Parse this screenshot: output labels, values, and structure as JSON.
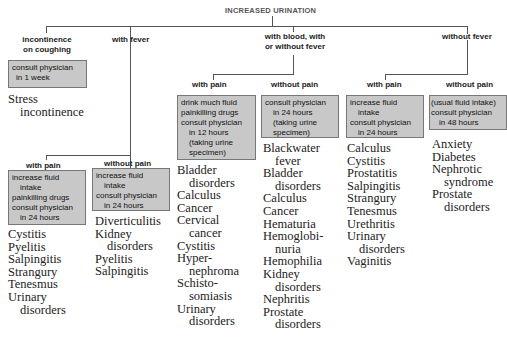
{
  "title": "INCREASED URINATION",
  "branches": {
    "incontinence": {
      "label": [
        "incontinence",
        "on coughing"
      ],
      "advice": [
        {
          "t": "consult physician",
          "i": false
        },
        {
          "t": "in 1 week",
          "i": true
        }
      ],
      "conditions": [
        {
          "t": "Stress",
          "i": false
        },
        {
          "t": "incontinence",
          "i": true
        }
      ]
    },
    "fever": {
      "label": "with fever",
      "with_pain": {
        "label": "with pain",
        "advice": [
          {
            "t": "increase fluid",
            "i": false
          },
          {
            "t": "intake",
            "i": true
          },
          {
            "t": "painkilling drugs",
            "i": false
          },
          {
            "t": "consult physician",
            "i": false
          },
          {
            "t": "in 24 hours",
            "i": true
          }
        ],
        "conditions": [
          {
            "t": "Cystitis",
            "i": false
          },
          {
            "t": "Pyelitis",
            "i": false
          },
          {
            "t": "Salpingitis",
            "i": false
          },
          {
            "t": "Strangury",
            "i": false
          },
          {
            "t": "Tenesmus",
            "i": false
          },
          {
            "t": "Urinary",
            "i": false
          },
          {
            "t": "disorders",
            "i": true
          }
        ]
      },
      "without_pain": {
        "label": "without pain",
        "advice": [
          {
            "t": "increase fluid",
            "i": false
          },
          {
            "t": "intake",
            "i": true
          },
          {
            "t": "consult physician",
            "i": false
          },
          {
            "t": "in 24 hours",
            "i": true
          }
        ],
        "conditions": [
          {
            "t": "Diverticulitis",
            "i": false
          },
          {
            "t": "Kidney",
            "i": false
          },
          {
            "t": "disorders",
            "i": true
          },
          {
            "t": "Pyelitis",
            "i": false
          },
          {
            "t": "Salpingitis",
            "i": false
          }
        ]
      }
    },
    "blood": {
      "label": [
        "with blood, with",
        "or without fever"
      ],
      "with_pain": {
        "label": "with pain",
        "advice": [
          {
            "t": "drink much fluid",
            "i": false
          },
          {
            "t": "painkilling drugs",
            "i": false
          },
          {
            "t": "consult physician",
            "i": false
          },
          {
            "t": "in 12 hours",
            "i": true
          },
          {
            "t": "(taking urine",
            "i": true
          },
          {
            "t": "specimen)",
            "i": true
          }
        ],
        "conditions": [
          {
            "t": "Bladder",
            "i": false
          },
          {
            "t": "disorders",
            "i": true
          },
          {
            "t": "Calculus",
            "i": false
          },
          {
            "t": "Cancer",
            "i": false
          },
          {
            "t": "Cervical",
            "i": false
          },
          {
            "t": "cancer",
            "i": true
          },
          {
            "t": "Cystitis",
            "i": false
          },
          {
            "t": "Hyper-",
            "i": false
          },
          {
            "t": "nephroma",
            "i": true
          },
          {
            "t": "Schisto-",
            "i": false
          },
          {
            "t": "somiasis",
            "i": true
          },
          {
            "t": "Urinary",
            "i": false
          },
          {
            "t": "disorders",
            "i": true
          }
        ]
      },
      "without_pain": {
        "label": "without pain",
        "advice": [
          {
            "t": "consult physician",
            "i": false
          },
          {
            "t": "in 24 hours",
            "i": true
          },
          {
            "t": "(taking urine",
            "i": true
          },
          {
            "t": "specimen)",
            "i": true
          }
        ],
        "conditions": [
          {
            "t": "Blackwater",
            "i": false
          },
          {
            "t": "fever",
            "i": true
          },
          {
            "t": "Bladder",
            "i": false
          },
          {
            "t": "disorders",
            "i": true
          },
          {
            "t": "Calculus",
            "i": false
          },
          {
            "t": "Cancer",
            "i": false
          },
          {
            "t": "Hematuria",
            "i": false
          },
          {
            "t": "Hemoglobi-",
            "i": false
          },
          {
            "t": "nuria",
            "i": true
          },
          {
            "t": "Hemophilia",
            "i": false
          },
          {
            "t": "Kidney",
            "i": false
          },
          {
            "t": "disorders",
            "i": true
          },
          {
            "t": "Nephritis",
            "i": false
          },
          {
            "t": "Prostate",
            "i": false
          },
          {
            "t": "disorders",
            "i": true
          }
        ]
      }
    },
    "no_fever": {
      "label": "without fever",
      "with_pain": {
        "label": "with pain",
        "advice": [
          {
            "t": "increase fluid",
            "i": false
          },
          {
            "t": "intake",
            "i": true
          },
          {
            "t": "consult physician",
            "i": false
          },
          {
            "t": "in 24 hours",
            "i": true
          }
        ],
        "conditions": [
          {
            "t": "Calculus",
            "i": false
          },
          {
            "t": "Cystitis",
            "i": false
          },
          {
            "t": "Prostatitis",
            "i": false
          },
          {
            "t": "Salpingitis",
            "i": false
          },
          {
            "t": "Strangury",
            "i": false
          },
          {
            "t": "Tenesmus",
            "i": false
          },
          {
            "t": "Urethritis",
            "i": false
          },
          {
            "t": "Urinary",
            "i": false
          },
          {
            "t": "disorders",
            "i": true
          },
          {
            "t": "Vaginitis",
            "i": false
          }
        ]
      },
      "without_pain": {
        "label": "without pain",
        "advice": [
          {
            "t": "(usual fluid intake)",
            "i": false
          },
          {
            "t": "consult physician",
            "i": false
          },
          {
            "t": "in 48 hours",
            "i": true
          }
        ],
        "conditions": [
          {
            "t": "Anxiety",
            "i": false
          },
          {
            "t": "Diabetes",
            "i": false
          },
          {
            "t": "Nephrotic",
            "i": false
          },
          {
            "t": "syndrome",
            "i": true
          },
          {
            "t": "Prostate",
            "i": false
          },
          {
            "t": "disorders",
            "i": true
          }
        ]
      }
    }
  },
  "colors": {
    "box_fill": "#c8c8c8",
    "box_border": "#777777",
    "line": "#555555",
    "text": "#222222"
  }
}
